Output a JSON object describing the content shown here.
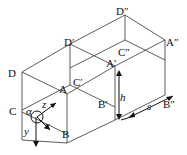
{
  "diagram": {
    "type": "isometric-box-grid",
    "vertex_labels": {
      "D": "D",
      "C": "C",
      "A": "A",
      "B": "B",
      "D_prime": "D′",
      "C_prime": "C′",
      "A_prime": "A′",
      "B_prime": "B′",
      "D_dprime": "D″",
      "C_dprime": "C″",
      "A_dprime": "A″",
      "B_dprime": "B″"
    },
    "axis_labels": {
      "x": "x",
      "y": "y",
      "z": "z",
      "alpha": "α"
    },
    "dimension_labels": {
      "height": "h",
      "spacing": "s"
    },
    "colors": {
      "line": "#333333",
      "text": "#111111",
      "background": "#ffffff"
    }
  }
}
